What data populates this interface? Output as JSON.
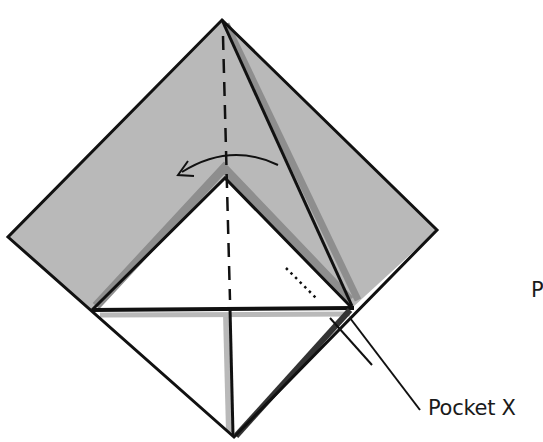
{
  "diagram": {
    "type": "origami-fold-step",
    "colors": {
      "paper_colored": "#b9b9b9",
      "paper_shadow": "#8e8e8e",
      "paper_white": "#ffffff",
      "line": "#111111"
    },
    "annotations": {
      "pocket_label": "Pocket X",
      "cut_off_label": "P"
    },
    "symbols": {
      "valley_fold_line": "dashed vertical center line",
      "fold_arrow": "curved arrow pointing left",
      "pocket_indicator": "dotted line into pocket"
    }
  }
}
